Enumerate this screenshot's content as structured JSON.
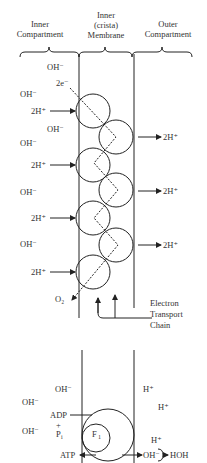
{
  "headers": {
    "inner_compartment": [
      "Inner",
      "Compartment"
    ],
    "membrane": [
      "Inner",
      "(crista)",
      "Membrane"
    ],
    "outer_compartment": [
      "Outer",
      "Compartment"
    ]
  },
  "top_panel": {
    "electron_label": "2e⁻",
    "hydroxide": "OH⁻",
    "proton_in": "2H⁺",
    "proton_out": "2H⁺",
    "oxygen": "O₂",
    "etc_label": [
      "Electron",
      "Transport",
      "Chain"
    ]
  },
  "bottom_panel": {
    "hydroxide": "OH⁻",
    "proton": "H⁺",
    "adp": "ADP",
    "plus": "+",
    "pi": "P",
    "pi_sub": "i",
    "f1_label": "F",
    "f1_sub": "1",
    "atp": "ATP",
    "oh_out": "OH⁻",
    "water": "HOH"
  },
  "colors": {
    "ink": "#222222",
    "text": "#333333",
    "background": "#ffffff"
  }
}
